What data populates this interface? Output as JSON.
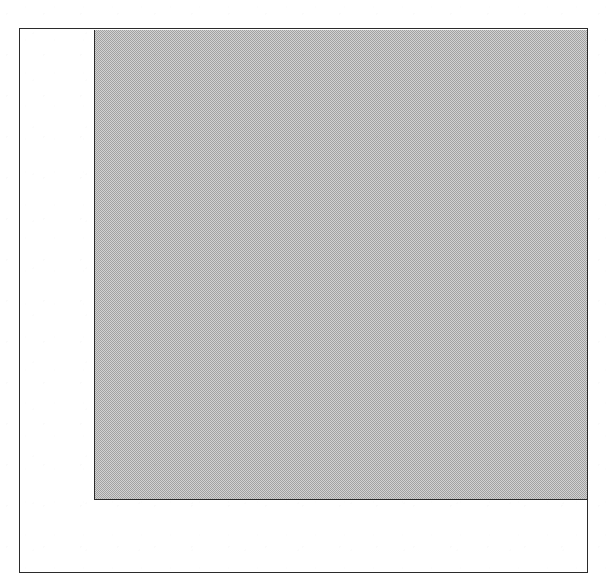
{
  "figure": {
    "kind": "scanned-figure",
    "background_color": "#ffffff",
    "frame": {
      "name": "outer-border",
      "stroke_color": "#2b2b2b",
      "stroke_width_px": 1,
      "x": 19,
      "y": 28,
      "width": 569,
      "height": 545
    },
    "shapes": [
      {
        "name": "shaded-rectangle",
        "shape": "rectangle",
        "fill": "dither-halftone-gray",
        "fill_color": "#d2d2d2",
        "stroke_color": "#2b2b2b",
        "stroke_width_px": 1,
        "stroke_edges": "left,bottom",
        "x": 94,
        "y": 30,
        "width": 493,
        "height": 470,
        "anchored": "top-right"
      }
    ],
    "white_margins": {
      "left_strip": {
        "name": "left-white-margin",
        "x": 20,
        "y": 30,
        "width": 74,
        "height": 543
      },
      "bottom_strip": {
        "name": "bottom-white-margin",
        "x": 20,
        "y": 500,
        "width": 567,
        "height": 73
      }
    },
    "labels": [],
    "annotations": [],
    "text": []
  }
}
